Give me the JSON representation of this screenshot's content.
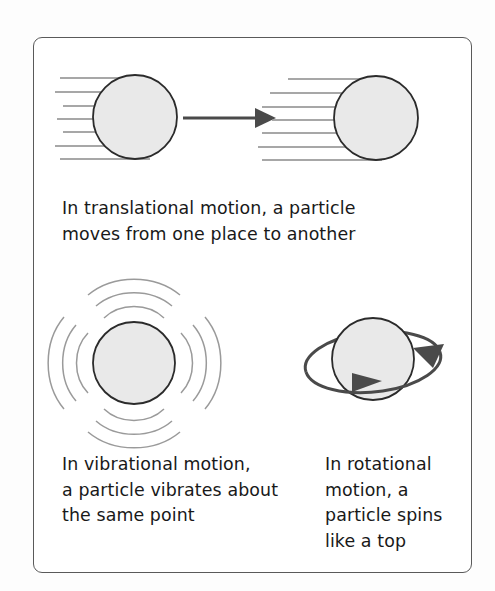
{
  "figure": {
    "background_color": "#ffffff",
    "frame_border_color": "#5a5a5a",
    "particle_fill_color": "#e9e9e9",
    "particle_stroke_color": "#2b2b2b",
    "arrow_color": "#444444",
    "motion_line_color": "#808080",
    "text_color": "#191919"
  },
  "panels": {
    "translational": {
      "caption": "In translational motion, a particle\nmoves from one place to another",
      "caption_line_1": "In translational motion, a particle",
      "caption_line_2": "moves from one place to another",
      "particle_left_label": "particle-start",
      "particle_right_label": "particle-end",
      "arrow_label": "direction-of-travel",
      "speed_line_count": 7
    },
    "vibrational": {
      "caption": "In vibrational motion,\na particle vibrates about\nthe same point",
      "caption_line_1": "In vibrational motion,",
      "caption_line_2": "a particle vibrates about",
      "caption_line_3": "the same point",
      "particle_label": "vibrating-particle",
      "arc_sets": 4,
      "arcs_per_set": 3
    },
    "rotational": {
      "caption": "In rotational\nmotion, a\nparticle spins\nlike a top",
      "caption_line_1": "In rotational",
      "caption_line_2": "motion, a",
      "caption_line_3": "particle spins",
      "caption_line_4": "like a top",
      "particle_label": "spinning-particle",
      "orbit_label": "rotation-ring",
      "arrow_count": 2
    }
  }
}
